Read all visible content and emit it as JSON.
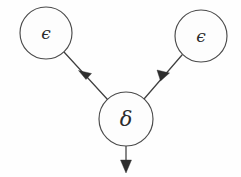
{
  "diagram": {
    "type": "directed-graph",
    "background_color": "#fefefe",
    "stroke_color": "#3f3f3f",
    "node_fill_color": "#fdfdfd",
    "nodes": [
      {
        "id": "eps-left",
        "label": "ϵ",
        "label_name": "epsilon",
        "cx": 46,
        "cy": 33,
        "r": 26
      },
      {
        "id": "eps-right",
        "label": "ϵ",
        "label_name": "epsilon",
        "cx": 201,
        "cy": 36,
        "r": 26
      },
      {
        "id": "delta",
        "label": "δ",
        "label_name": "delta",
        "cx": 126,
        "cy": 119,
        "r": 27
      }
    ],
    "edges": [
      {
        "id": "edge-eps-left-to-delta",
        "from": "eps-left",
        "to": "delta",
        "x1": 64,
        "y1": 52,
        "x2": 108,
        "y2": 100,
        "arrow_x": 86,
        "arrow_y": 76,
        "direction": "down-right"
      },
      {
        "id": "edge-eps-right-to-delta",
        "from": "eps-right",
        "to": "delta",
        "x1": 182,
        "y1": 55,
        "x2": 144,
        "y2": 99,
        "arrow_x": 163,
        "arrow_y": 77,
        "direction": "down-left"
      },
      {
        "id": "edge-delta-out",
        "from": "delta",
        "to": null,
        "x1": 126,
        "y1": 146,
        "x2": 126,
        "y2": 172,
        "arrow_x": 126,
        "arrow_y": 172,
        "direction": "down"
      }
    ]
  }
}
